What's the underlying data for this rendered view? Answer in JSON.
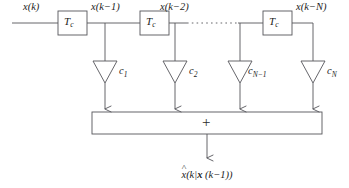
{
  "figure": {
    "type": "block-diagram",
    "background_color": "#ffffff",
    "line_color": "#55555a",
    "text_color": "#1c1c1c"
  },
  "input": {
    "label": "x(k)"
  },
  "delays": [
    {
      "id": "delay-1",
      "label": "T",
      "subscript": "c"
    },
    {
      "id": "delay-2",
      "label": "T",
      "subscript": "c"
    },
    {
      "id": "delay-n",
      "label": "T",
      "subscript": "c"
    }
  ],
  "taps": [
    {
      "signal": "x(k−1)",
      "coef": "c",
      "coef_sub": "1"
    },
    {
      "signal": "x(k−2)",
      "coef": "c",
      "coef_sub": "2"
    },
    {
      "signal": "",
      "coef": "c",
      "coef_sub": "N−1"
    },
    {
      "signal": "x(k−N)",
      "coef": "c",
      "coef_sub": "N"
    }
  ],
  "ellipsis": {
    "style": "dotted-horizontal-line"
  },
  "summer": {
    "symbol": "+"
  },
  "output": {
    "hat": "˄",
    "base": "x",
    "rest_a": "(k|",
    "bold_x": "x",
    "rest_b": "(k−1))",
    "full_text": "x̂(k| x (k−1))"
  }
}
